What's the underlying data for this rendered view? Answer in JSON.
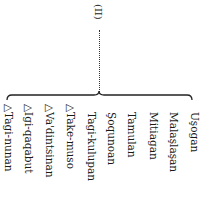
{
  "root": {
    "label": "(II)"
  },
  "columns": [
    {
      "label": "△Tagi-nunan",
      "x": 3,
      "y": 104
    },
    {
      "label": "△Igi-qaqabut",
      "x": 23,
      "y": 104
    },
    {
      "label": "△Va'dintsinan",
      "x": 44,
      "y": 104
    },
    {
      "label": "△Take-muso",
      "x": 65,
      "y": 104
    },
    {
      "label": "Tagi-kulupan",
      "x": 86,
      "y": 112
    },
    {
      "label": "Şoqunoan",
      "x": 106,
      "y": 112
    },
    {
      "label": "Tamulan",
      "x": 126,
      "y": 112
    },
    {
      "label": "Mitiagan",
      "x": 148,
      "y": 112
    },
    {
      "label": "Malaşlaşan",
      "x": 168,
      "y": 112
    },
    {
      "label": "Uşogan",
      "x": 189,
      "y": 112
    }
  ]
}
